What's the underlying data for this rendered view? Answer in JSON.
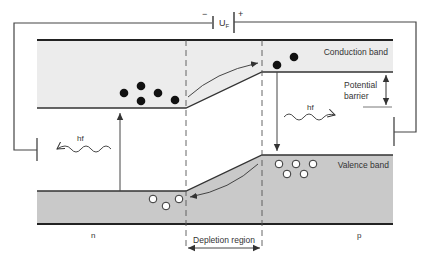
{
  "diagram": {
    "colors": {
      "conduction_fill": "#ececec",
      "valence_fill": "#c9c9c9",
      "line": "#333333",
      "electron": "#111111",
      "hole_fill": "#ffffff"
    },
    "battery": {
      "minus": "−",
      "plus": "+",
      "label_main": "U",
      "label_sub": "F"
    },
    "labels": {
      "conduction_band": "Conduction band",
      "valence_band": "Valence band",
      "potential_barrier_1": "Potential",
      "potential_barrier_2": "barrier",
      "photon_left": "hf",
      "photon_right": "hf",
      "n_region": "n",
      "p_region": "p",
      "depletion_region": "Depletion region"
    },
    "carriers": {
      "electrons_n_count": 6,
      "electrons_p_count": 2,
      "holes_n_count": 3,
      "holes_p_count": 5
    }
  }
}
